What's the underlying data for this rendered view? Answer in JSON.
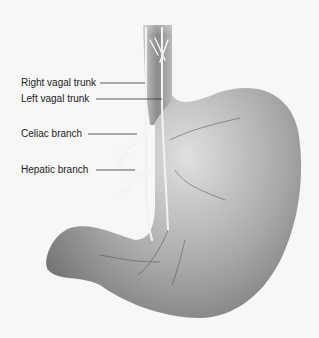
{
  "diagram": {
    "labels": [
      {
        "id": "right-vagal-trunk",
        "text": "Right vagal trunk"
      },
      {
        "id": "left-vagal-trunk",
        "text": "Left vagal trunk"
      },
      {
        "id": "celiac-branch",
        "text": "Celiac branch"
      },
      {
        "id": "hepatic-branch",
        "text": "Hepatic branch"
      }
    ],
    "colors": {
      "background": "#f7f7f7",
      "organ_dark": "#7a7a7a",
      "organ_light": "#d8d8d8",
      "nerve": "#f0f0f0",
      "label_text": "#222222",
      "leader_line": "#333333"
    }
  }
}
